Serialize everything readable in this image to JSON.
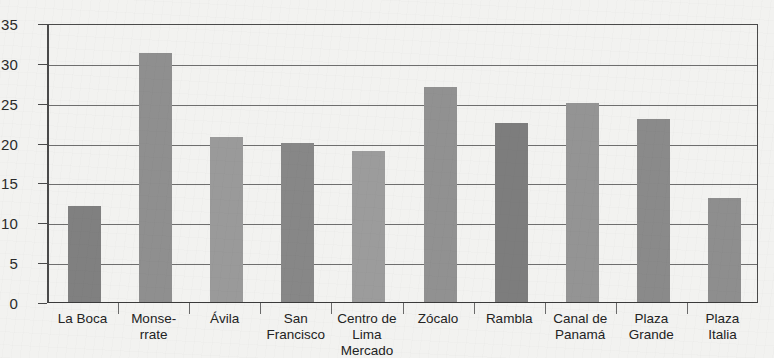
{
  "chart_data": {
    "type": "bar",
    "title": "",
    "xlabel": "",
    "ylabel": "",
    "ylim": [
      0,
      35
    ],
    "yticks": [
      0,
      5,
      10,
      15,
      20,
      25,
      30,
      35
    ],
    "grid": true,
    "legend": "none",
    "categories": [
      "La Boca",
      "Monse-rrate",
      "Ávila",
      "San Francisco",
      "Centro de Lima Mercado",
      "Zócalo",
      "Rambla",
      "Canal de Panamá",
      "Plaza Grande",
      "Plaza Italia"
    ],
    "category_lines": [
      [
        "La Boca"
      ],
      [
        "Monse-",
        "rrate"
      ],
      [
        "Ávila"
      ],
      [
        "San",
        "Francisco"
      ],
      [
        "Centro de",
        "Lima",
        "Mercado"
      ],
      [
        "Zócalo"
      ],
      [
        "Rambla"
      ],
      [
        "Canal de",
        "Panamá"
      ],
      [
        "Plaza",
        "Grande"
      ],
      [
        "Plaza",
        "Italia"
      ]
    ],
    "values": [
      12.0,
      31.2,
      20.7,
      20.0,
      19.0,
      27.0,
      22.4,
      25.0,
      23.0,
      13.0
    ],
    "bar_colors": [
      "#808080",
      "#8f8f8f",
      "#9a9a9a",
      "#878787",
      "#9c9c9c",
      "#919191",
      "#7d7d7d",
      "#949494",
      "#8a8a8a",
      "#8e8e8e"
    ]
  },
  "axis": {
    "tick_labels": [
      "0",
      "5",
      "10",
      "15",
      "20",
      "25",
      "30",
      "35"
    ]
  },
  "colors": {
    "background": "#f2f2f0",
    "axis_line": "#4a4a4a",
    "gridline": "#6e6e6e",
    "tick_text": "#2b2b2b",
    "label_text": "#232323"
  }
}
